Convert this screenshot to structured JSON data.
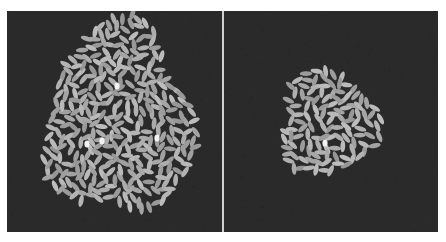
{
  "figure": {
    "panels": [
      {
        "id": "left",
        "description": "Large irregular cluster of rice grains on dark background",
        "background": "#2a2a2a",
        "grain_color": "#a8a8a8",
        "highlight_color": "#f2f2f2",
        "cluster": {
          "cx": 112,
          "cy": 110,
          "rx": 72,
          "ry": 95,
          "count": 330
        },
        "highlights": [
          [
            80,
            133
          ],
          [
            95,
            130
          ],
          [
            150,
            127
          ],
          [
            110,
            75
          ]
        ]
      },
      {
        "id": "right",
        "description": "Small round cluster of rice grains on dark background",
        "background": "#2a2a2a",
        "grain_color": "#a8a8a8",
        "highlight_color": "#f2f2f2",
        "cluster": {
          "cx": 104,
          "cy": 112,
          "rx": 48,
          "ry": 52,
          "count": 120
        },
        "highlights": [
          [
            101,
            132
          ]
        ]
      }
    ]
  }
}
